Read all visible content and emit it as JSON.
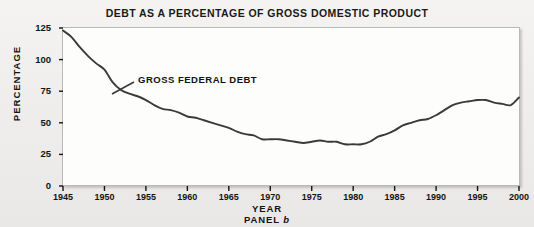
{
  "chart_data": {
    "type": "line",
    "title": "DEBT AS A PERCENTAGE OF GROSS DOMESTIC PRODUCT",
    "subtitle": "PANEL b",
    "panel": "b",
    "xlabel": "YEAR",
    "ylabel": "PERCENTAGE",
    "xlim": [
      1945,
      2000
    ],
    "ylim": [
      0,
      125
    ],
    "yticks": [
      0,
      25,
      50,
      75,
      100,
      125
    ],
    "xticks": [
      1945,
      1950,
      1955,
      1960,
      1965,
      1970,
      1975,
      1980,
      1985,
      1990,
      1995,
      2000
    ],
    "grid": false,
    "legend_position": "inline-annotation",
    "line_color": "#3a3a3a",
    "series": [
      {
        "name": "GROSS FEDERAL DEBT",
        "annotation": "GROSS FEDERAL DEBT",
        "x": [
          1945,
          1946,
          1947,
          1948,
          1949,
          1950,
          1951,
          1952,
          1953,
          1954,
          1955,
          1956,
          1957,
          1958,
          1959,
          1960,
          1961,
          1962,
          1963,
          1964,
          1965,
          1966,
          1967,
          1968,
          1969,
          1970,
          1971,
          1972,
          1973,
          1974,
          1975,
          1976,
          1977,
          1978,
          1979,
          1980,
          1981,
          1982,
          1983,
          1984,
          1985,
          1986,
          1987,
          1988,
          1989,
          1990,
          1991,
          1992,
          1993,
          1994,
          1995,
          1996,
          1997,
          1998,
          1999,
          2000
        ],
        "values": [
          123,
          118,
          110,
          103,
          97,
          92,
          82,
          76,
          73,
          71,
          68,
          64,
          61,
          60,
          58,
          55,
          54,
          52,
          50,
          48,
          46,
          43,
          41,
          40,
          37,
          37,
          37,
          36,
          35,
          34,
          35,
          36,
          35,
          35,
          33,
          33,
          33,
          35,
          39,
          41,
          44,
          48,
          50,
          52,
          53,
          56,
          60,
          64,
          66,
          67,
          68,
          68,
          66,
          65,
          64,
          70
        ],
        "start_value": 123,
        "peak_value": 68,
        "peak_year": 1995,
        "trough_value": 33,
        "trough_year": 1981,
        "end_value": 70
      }
    ]
  },
  "axes": {
    "y_tick_labels": [
      "125",
      "100",
      "75",
      "50",
      "25",
      "0"
    ],
    "x_tick_labels": [
      "1945",
      "1950",
      "1955",
      "1960",
      "1965",
      "1970",
      "1975",
      "1980",
      "1985",
      "1990",
      "1995",
      "2000"
    ]
  },
  "colors": {
    "background": "#eeedeb",
    "plot_background": "#fdfdfc",
    "line": "#3a3a3a",
    "text": "#141414",
    "frame": "#b9b9b7"
  }
}
